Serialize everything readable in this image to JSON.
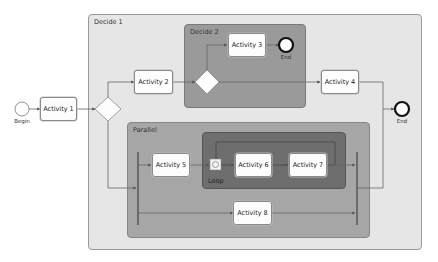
{
  "diagram": {
    "type": "BPMN process flow",
    "containers": {
      "decide1": {
        "label": "Decide 1"
      },
      "decide2": {
        "label": "Decide 2"
      },
      "parallel": {
        "label": "Parallel"
      },
      "loop": {
        "label": "Loop"
      }
    },
    "events": {
      "begin": {
        "label": "Begin"
      },
      "end_decide2": {
        "label": "End"
      },
      "end_main": {
        "label": "End"
      }
    },
    "activities": [
      {
        "id": "a1",
        "label": "Activity 1"
      },
      {
        "id": "a2",
        "label": "Activity 2"
      },
      {
        "id": "a3",
        "label": "Activity 3"
      },
      {
        "id": "a4",
        "label": "Activity 4"
      },
      {
        "id": "a5",
        "label": "Activity 5"
      },
      {
        "id": "a6",
        "label": "Activity 6"
      },
      {
        "id": "a7",
        "label": "Activity 7"
      },
      {
        "id": "a8",
        "label": "Activity 8"
      }
    ],
    "colors": {
      "decide1_fill": "#e6e6e6",
      "decide2_fill": "#9a9a9a",
      "parallel_fill": "#a6a6a6",
      "loop_fill": "#6e6e6e",
      "line": "#666666"
    }
  }
}
